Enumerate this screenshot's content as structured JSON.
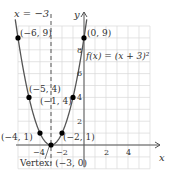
{
  "chart_data": {
    "type": "line",
    "title": "",
    "function_label": "f(x) = (x + 3)²",
    "xlabel": "x",
    "ylabel": "y",
    "xlim": [
      -6,
      6
    ],
    "ylim": [
      -2,
      10
    ],
    "x_ticks": [
      "-4",
      "-2",
      "2",
      "4"
    ],
    "y_ticks": [
      "2",
      "4",
      "6",
      "8"
    ],
    "grid": true,
    "axis_of_symmetry_label": "x = −3",
    "vertex_label": "Vertex: (−3, 0)",
    "series": [
      {
        "name": "f(x) = (x + 3)^2",
        "x": [
          -6,
          -5,
          -4,
          -3,
          -2,
          -1,
          0
        ],
        "values": [
          9,
          4,
          1,
          0,
          1,
          4,
          9
        ]
      }
    ],
    "points": [
      {
        "x": -6,
        "y": 9,
        "label": "(−6, 9)"
      },
      {
        "x": -5,
        "y": 4,
        "label": "(−5, 4)"
      },
      {
        "x": -4,
        "y": 1,
        "label": "(−4, 1)"
      },
      {
        "x": -3,
        "y": 0,
        "label": "Vertex: (−3, 0)"
      },
      {
        "x": -2,
        "y": 1,
        "label": "(−2, 1)"
      },
      {
        "x": -1,
        "y": 4,
        "label": "(−1, 4)"
      },
      {
        "x": 0,
        "y": 9,
        "label": "(0, 9)"
      }
    ]
  },
  "labels": {
    "sym": "x = −3",
    "func": "f(x) = (x + 3)²",
    "p_m6_9": "(−6, 9)",
    "p_m5_4": "(−5, 4)",
    "p_m4_1": "(−4, 1)",
    "p_m2_1": "(−2, 1)",
    "p_m1_4": "(−1, 4)",
    "p_0_9": "(0, 9)",
    "vertex": "Vertex: (−3, 0)",
    "x_axis": "x",
    "y_axis": "y",
    "xt_m4": "−4",
    "xt_m2": "−2",
    "xt_2": "2",
    "xt_4": "4",
    "yt_2": "2",
    "yt_4": "4",
    "yt_6": "6",
    "yt_8": "8"
  },
  "colors": {
    "grid": "#d9d9d9",
    "axis": "#555555",
    "curve": "#555555",
    "point": "#000000"
  }
}
